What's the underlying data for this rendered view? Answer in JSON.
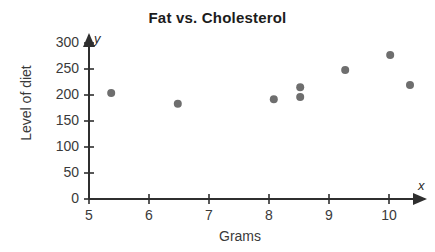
{
  "chart_data": {
    "type": "scatter",
    "title": "Fat vs. Cholesterol",
    "xlabel": "Grams",
    "ylabel": "Level of diet",
    "xlim": [
      5,
      10.55
    ],
    "ylim": [
      0,
      315
    ],
    "xticks": [
      "5",
      "6",
      "7",
      "8",
      "9",
      "10"
    ],
    "xtick_values": [
      5,
      6,
      7,
      8,
      9,
      10
    ],
    "yticks": [
      "0",
      "50",
      "100",
      "150",
      "200",
      "250",
      "300"
    ],
    "ytick_values": [
      0,
      50,
      100,
      150,
      200,
      250,
      300
    ],
    "grid": false,
    "legend": false,
    "x_axis_letter": "x",
    "y_axis_letter": "y",
    "point_color": "#6e6e6e",
    "axis_color": "#2f2f2f",
    "title_color": "#1c1c1c",
    "points": [
      {
        "x": 5.37,
        "y": 204
      },
      {
        "x": 6.48,
        "y": 183
      },
      {
        "x": 8.08,
        "y": 192
      },
      {
        "x": 8.52,
        "y": 215
      },
      {
        "x": 8.52,
        "y": 196
      },
      {
        "x": 9.27,
        "y": 248
      },
      {
        "x": 10.02,
        "y": 277
      },
      {
        "x": 10.35,
        "y": 219
      }
    ]
  }
}
